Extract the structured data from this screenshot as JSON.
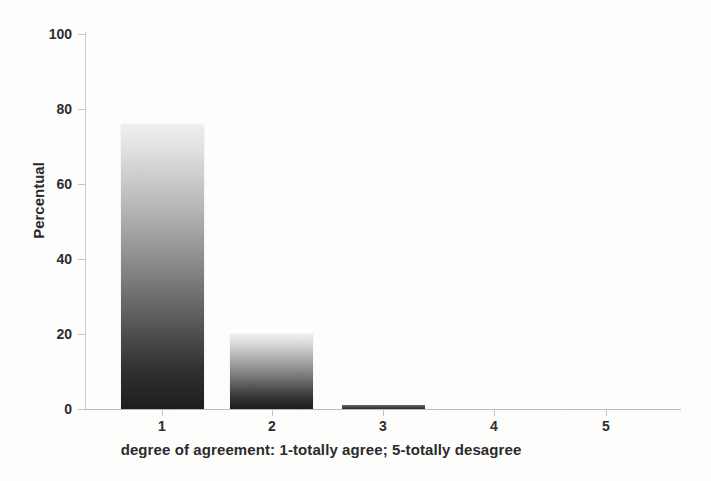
{
  "chart_data": {
    "type": "bar",
    "title": "",
    "subtitle": "",
    "categories": [
      "1",
      "2",
      "3",
      "4",
      "5"
    ],
    "values": [
      76,
      20,
      1,
      0,
      0
    ],
    "series": [
      {
        "name": "Percentual",
        "values": [
          76,
          20,
          1,
          0,
          0
        ]
      }
    ],
    "xlabel": "degree of agreement: 1-totally agree; 5-totally desagree",
    "ylabel": "Percentual",
    "ylim": [
      0,
      100
    ],
    "ytick_values": [
      0,
      20,
      40,
      60,
      80,
      100
    ],
    "ytick_labels": [
      "0",
      "20",
      "40",
      "60",
      "80",
      "100"
    ],
    "xtick_labels": [
      "1",
      "2",
      "3",
      "4",
      "5"
    ],
    "grid": false,
    "legend": false,
    "legend_position": "none",
    "bar_fill": "vertical gradient light-gray to black",
    "colors": {
      "bar_top": "#efefef",
      "bar_bottom": "#1d1d1d",
      "axis": "#c4c4c4",
      "text": "#2b2b2b",
      "background": "#fdfdfc"
    }
  }
}
